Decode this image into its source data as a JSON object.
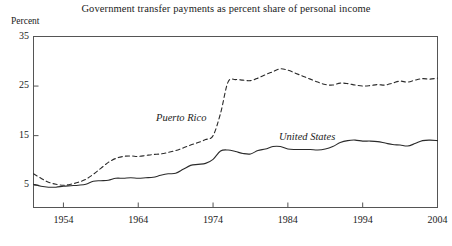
{
  "figure": {
    "title": "Government transfer payments as percent share of personal income",
    "ylabel": "Percent"
  },
  "chart_data": {
    "type": "line",
    "title": "Government transfer payments as percent share of personal income",
    "xlabel": "",
    "ylabel": "Percent",
    "xlim": [
      1950,
      2004
    ],
    "ylim": [
      0.5,
      35
    ],
    "grid": false,
    "legend": "inline-annotations",
    "yticks": [
      5,
      15,
      25,
      35
    ],
    "ytick_labels": [
      "5",
      "15",
      "25",
      "35"
    ],
    "xticks": [
      1954,
      1964,
      1974,
      1984,
      1994,
      2004
    ],
    "xtick_labels": [
      "1954",
      "1964",
      "1974",
      "1984",
      "1994",
      "2004"
    ],
    "series": [
      {
        "name": "Puerto Rico",
        "style": "dashed",
        "color": "#2b2b2b",
        "label_x": 1969,
        "label_y": 17.2,
        "x": [
          1950,
          1951,
          1952,
          1953,
          1954,
          1955,
          1956,
          1957,
          1958,
          1959,
          1960,
          1961,
          1962,
          1963,
          1964,
          1965,
          1966,
          1967,
          1968,
          1969,
          1970,
          1971,
          1972,
          1973,
          1974,
          1975,
          1976,
          1977,
          1978,
          1979,
          1980,
          1981,
          1982,
          1983,
          1984,
          1985,
          1986,
          1987,
          1988,
          1989,
          1990,
          1991,
          1992,
          1993,
          1994,
          1995,
          1996,
          1997,
          1998,
          1999,
          2000,
          2001,
          2002,
          2003,
          2004
        ],
        "y": [
          7.3,
          6.4,
          5.6,
          5.2,
          5.0,
          5.2,
          5.6,
          6.2,
          7.2,
          8.4,
          9.6,
          10.4,
          10.8,
          10.9,
          10.8,
          11.0,
          11.2,
          11.3,
          11.6,
          12.0,
          12.5,
          13.1,
          13.6,
          14.2,
          15.0,
          19.5,
          25.8,
          26.3,
          26.2,
          26.1,
          26.6,
          27.3,
          27.9,
          28.5,
          28.2,
          27.6,
          27.0,
          26.4,
          25.8,
          25.3,
          25.2,
          25.6,
          25.5,
          25.2,
          25.0,
          25.1,
          25.3,
          25.2,
          25.6,
          26.0,
          25.8,
          26.2,
          26.5,
          26.4,
          26.6
        ]
      },
      {
        "name": "United States",
        "style": "solid",
        "color": "#2b2b2b",
        "label_x": 1987,
        "label_y": 13.6,
        "x": [
          1950,
          1951,
          1952,
          1953,
          1954,
          1955,
          1956,
          1957,
          1958,
          1959,
          1960,
          1961,
          1962,
          1963,
          1964,
          1965,
          1966,
          1967,
          1968,
          1969,
          1970,
          1971,
          1972,
          1973,
          1974,
          1975,
          1976,
          1977,
          1978,
          1979,
          1980,
          1981,
          1982,
          1983,
          1984,
          1985,
          1986,
          1987,
          1988,
          1989,
          1990,
          1991,
          1992,
          1993,
          1994,
          1995,
          1996,
          1997,
          1998,
          1999,
          2000,
          2001,
          2002,
          2003,
          2004
        ],
        "y": [
          5.2,
          4.8,
          4.6,
          4.6,
          4.8,
          4.9,
          5.0,
          5.2,
          5.8,
          5.9,
          6.0,
          6.4,
          6.4,
          6.5,
          6.4,
          6.5,
          6.6,
          7.0,
          7.3,
          7.4,
          8.2,
          9.0,
          9.2,
          9.4,
          10.2,
          11.9,
          12.1,
          11.8,
          11.4,
          11.3,
          12.0,
          12.3,
          12.8,
          12.8,
          12.3,
          12.2,
          12.2,
          12.2,
          12.1,
          12.3,
          12.8,
          13.6,
          14.0,
          14.1,
          13.9,
          13.9,
          13.8,
          13.5,
          13.2,
          13.1,
          12.9,
          13.4,
          14.0,
          14.1,
          14.0
        ]
      }
    ]
  }
}
